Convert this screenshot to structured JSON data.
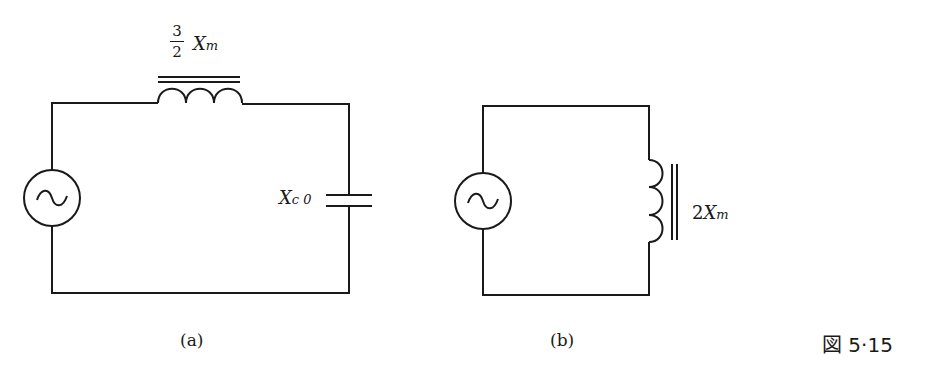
{
  "figure_number": "図 5·15",
  "circuit_a": {
    "caption": "(a)",
    "source": "ac-voltage-source",
    "inductor": {
      "coef_num": "3",
      "coef_den": "2",
      "symbol": "X",
      "subscript": "m"
    },
    "capacitor": {
      "symbol": "X",
      "subscript": "c 0"
    }
  },
  "circuit_b": {
    "caption": "(b)",
    "source": "ac-voltage-source",
    "inductor": {
      "coef": "2",
      "symbol": "X",
      "subscript": "m"
    }
  }
}
